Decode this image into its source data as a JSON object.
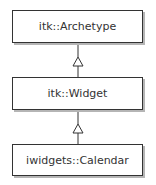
{
  "diagram": {
    "type": "uml-class-inheritance",
    "classes": [
      {
        "name": "itk::Archetype"
      },
      {
        "name": "itk::Widget"
      },
      {
        "name": "iwidgets::Calendar"
      }
    ],
    "relations": [
      {
        "from": "itk::Widget",
        "to": "itk::Archetype",
        "kind": "generalization"
      },
      {
        "from": "iwidgets::Calendar",
        "to": "itk::Widget",
        "kind": "generalization"
      }
    ],
    "colors": {
      "line": "#333333",
      "shadow": "#b5b5b5",
      "fill": "#ffffff"
    }
  }
}
